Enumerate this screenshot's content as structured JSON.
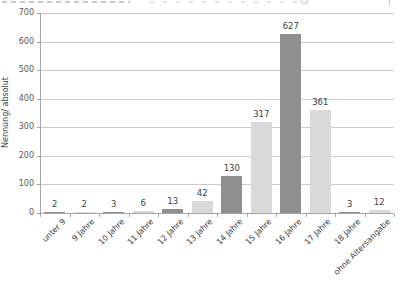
{
  "chart_data": {
    "type": "bar",
    "title": "",
    "categories": [
      "unter 9",
      "9 Jahre",
      "10 Jahre",
      "11 Jahre",
      "12 Jahre",
      "13 Jahre",
      "14 Jahre",
      "15 Jahre",
      "16 Jahre",
      "17 Jahre",
      "18 Jahre",
      "ohne Altersangabe"
    ],
    "values": [
      2,
      2,
      3,
      6,
      13,
      42,
      130,
      317,
      627,
      361,
      3,
      12
    ],
    "value_labels": [
      "2",
      "2",
      "3",
      "6",
      "13",
      "42",
      "130",
      "317",
      "627",
      "361",
      "3",
      "12"
    ],
    "bar_palette": {
      "dark": "#8f8f8f",
      "light": "#d9d9d9"
    },
    "bar_color_keys": [
      "dark",
      "light",
      "dark",
      "light",
      "dark",
      "light",
      "dark",
      "light",
      "dark",
      "light",
      "dark",
      "light"
    ],
    "xlabel": "",
    "ylabel": "Nennung/ absolut",
    "ylim": [
      0,
      700
    ],
    "yticks": [
      0,
      100,
      200,
      300,
      400,
      500,
      600,
      700
    ],
    "grid": true,
    "legend_position": "none",
    "x_tick_label_rotation_deg": -45
  },
  "colors": {
    "background": "#ffffff",
    "gridline": "#c9c9c9",
    "axis": "#a6a6a6",
    "tick_text": "#595959",
    "value_label_text": "#404040",
    "category_text": "#3f3f3f"
  }
}
